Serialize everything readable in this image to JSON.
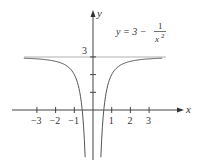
{
  "chart_data": {
    "type": "line",
    "title": "",
    "equation": {
      "lhs": "y = 3 −",
      "numerator": "1",
      "denominator": "x",
      "exponent": "2"
    },
    "function": "y = 3 - 1/x^2",
    "xlabel": "x",
    "ylabel": "y",
    "x_ticks": [
      -3,
      -2,
      -1,
      1,
      2,
      3
    ],
    "x_tick_labels": [
      "−3",
      "−2",
      "−1",
      "1",
      "2",
      "3"
    ],
    "y_ticks": [
      1,
      2,
      3
    ],
    "y_tick_labels": [
      "3"
    ],
    "asymptote": {
      "type": "horizontal",
      "y": 3,
      "label": "3"
    },
    "xlim": [
      -4.3,
      4.8
    ],
    "ylim": [
      -2.7,
      4.2
    ],
    "grid": false,
    "series": [
      {
        "name": "y = 3 - 1/x^2 (x<0)",
        "x": [
          -3.7,
          -3,
          -2,
          -1.5,
          -1,
          -0.8,
          -0.6,
          -0.5,
          -0.42
        ],
        "y": [
          2.93,
          2.89,
          2.75,
          2.56,
          2.0,
          1.44,
          0.22,
          -1.0,
          -2.67
        ]
      },
      {
        "name": "y = 3 - 1/x^2 (x>0)",
        "x": [
          0.42,
          0.5,
          0.6,
          0.8,
          1,
          1.5,
          2,
          3,
          3.7
        ],
        "y": [
          -2.67,
          -1.0,
          0.22,
          1.44,
          2.0,
          2.56,
          2.75,
          2.89,
          2.93
        ]
      }
    ]
  },
  "labels": {
    "x_axis": "x",
    "y_axis": "y",
    "asymptote_value": "3"
  },
  "colors": {
    "axis": "#444444",
    "curve": "#555555",
    "asymptote": "#aaaaaa",
    "text": "#333333"
  }
}
